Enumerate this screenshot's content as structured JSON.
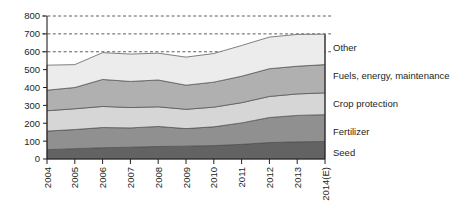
{
  "chart_data": {
    "type": "area",
    "title": "",
    "subtitle": "",
    "xlabel": "",
    "ylabel": "",
    "stacked": true,
    "grid": true,
    "gridlines": [
      600,
      700,
      800
    ],
    "legend_position": "right",
    "ylim": [
      0,
      800
    ],
    "yticks": [
      0,
      100,
      200,
      300,
      400,
      500,
      600,
      700,
      800
    ],
    "ytick_labels": [
      "0",
      "100",
      "200",
      "300",
      "400",
      "500",
      "600",
      "700",
      "800"
    ],
    "categories": [
      "2004",
      "2005",
      "2006",
      "2007",
      "2008",
      "2009",
      "2010",
      "2011",
      "2012",
      "2013",
      "2014(E)"
    ],
    "series": [
      {
        "name": "Seed",
        "color": "#636363",
        "values": [
          52,
          58,
          63,
          66,
          70,
          72,
          75,
          82,
          92,
          96,
          98
        ]
      },
      {
        "name": "Fertilizer",
        "color": "#909090",
        "values": [
          104,
          107,
          113,
          108,
          112,
          98,
          105,
          120,
          140,
          148,
          150
        ]
      },
      {
        "name": "Crop protection",
        "color": "#d6d6d6",
        "values": [
          114,
          116,
          118,
          114,
          110,
          108,
          110,
          113,
          118,
          120,
          122
        ]
      },
      {
        "name": "Fuels, energy, maintenance",
        "color": "#b0b0b0",
        "values": [
          115,
          119,
          151,
          146,
          150,
          135,
          140,
          148,
          155,
          155,
          158
        ]
      },
      {
        "name": "Other",
        "color": "#ececec",
        "values": [
          140,
          128,
          150,
          153,
          150,
          157,
          160,
          172,
          177,
          178,
          170
        ]
      }
    ],
    "totals": [
      525,
      528,
      595,
      587,
      592,
      570,
      590,
      635,
      682,
      697,
      698
    ]
  },
  "legend": {
    "items": [
      {
        "label": "Other"
      },
      {
        "label": "Fuels, energy, maintenance"
      },
      {
        "label": "Crop protection"
      },
      {
        "label": "Fertilizer"
      },
      {
        "label": "Seed"
      }
    ]
  }
}
